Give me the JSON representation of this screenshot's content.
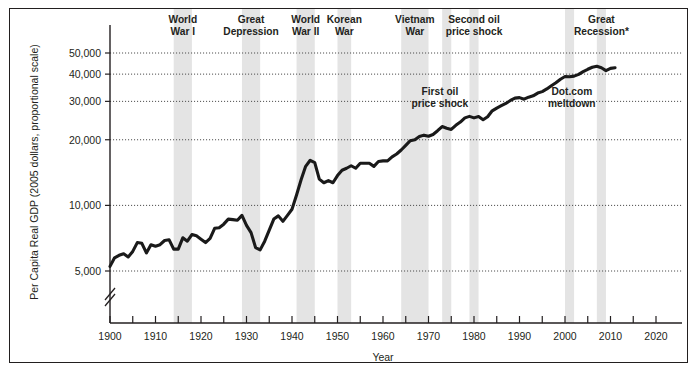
{
  "figure": {
    "background_color": "#ffffff",
    "border_color": "#221f1f",
    "line_color": "#1a1a1a",
    "band_color": "#e4e4e4",
    "grid_color": "#4d4d4d"
  },
  "chart_data": {
    "type": "line",
    "title": "",
    "xlabel": "Year",
    "ylabel": "Per Capita Real GDP (2005 dollars, proportional scale)",
    "yscale": "log",
    "ylim": [
      4300,
      57000
    ],
    "xlim": [
      1900,
      2020
    ],
    "grid": true,
    "legend": "none",
    "axis_break": true,
    "ytick_labels": [
      "5,000",
      "10,000",
      "20,000",
      "30,000",
      "40,000",
      "50,000"
    ],
    "ytick_values": [
      5000,
      10000,
      20000,
      30000,
      40000,
      50000
    ],
    "xtick_labels": [
      "1900",
      "1910",
      "1920",
      "1930",
      "1940",
      "1950",
      "1960",
      "1970",
      "1980",
      "1990",
      "2000",
      "2010",
      "2020"
    ],
    "xtick_values": [
      1900,
      1910,
      1920,
      1930,
      1940,
      1950,
      1960,
      1970,
      1980,
      1990,
      2000,
      2010,
      2020
    ],
    "xminor_values": [
      1905,
      1915,
      1925,
      1935,
      1945,
      1955,
      1965,
      1975,
      1985,
      1995,
      2005,
      2015
    ],
    "series_name": "Per Capita Real GDP",
    "x": [
      1900,
      1901,
      1902,
      1903,
      1904,
      1905,
      1906,
      1907,
      1908,
      1909,
      1910,
      1911,
      1912,
      1913,
      1914,
      1915,
      1916,
      1917,
      1918,
      1919,
      1920,
      1921,
      1922,
      1923,
      1924,
      1925,
      1926,
      1927,
      1928,
      1929,
      1930,
      1931,
      1932,
      1933,
      1934,
      1935,
      1936,
      1937,
      1938,
      1939,
      1940,
      1941,
      1942,
      1943,
      1944,
      1945,
      1946,
      1947,
      1948,
      1949,
      1950,
      1951,
      1952,
      1953,
      1954,
      1955,
      1956,
      1957,
      1958,
      1959,
      1960,
      1961,
      1962,
      1963,
      1964,
      1965,
      1966,
      1967,
      1968,
      1969,
      1970,
      1971,
      1972,
      1973,
      1974,
      1975,
      1976,
      1977,
      1978,
      1979,
      1980,
      1981,
      1982,
      1983,
      1984,
      1985,
      1986,
      1987,
      1988,
      1989,
      1990,
      1991,
      1992,
      1993,
      1994,
      1995,
      1996,
      1997,
      1998,
      1999,
      2000,
      2001,
      2002,
      2003,
      2004,
      2005,
      2006,
      2007,
      2008,
      2009,
      2010,
      2011
    ],
    "values": [
      5250,
      5750,
      5900,
      6000,
      5800,
      6150,
      6750,
      6700,
      6050,
      6600,
      6500,
      6600,
      6900,
      6950,
      6300,
      6300,
      7100,
      6850,
      7350,
      7250,
      7000,
      6750,
      7050,
      7850,
      7900,
      8200,
      8650,
      8600,
      8550,
      9000,
      8100,
      7500,
      6400,
      6250,
      6850,
      7700,
      8650,
      8950,
      8450,
      9000,
      9600,
      11150,
      13100,
      15100,
      16100,
      15700,
      13200,
      12700,
      13000,
      12700,
      13700,
      14500,
      14800,
      15200,
      14800,
      15600,
      15600,
      15600,
      15100,
      15900,
      16000,
      16000,
      16700,
      17200,
      17950,
      18850,
      19800,
      20000,
      20700,
      21000,
      20750,
      21150,
      22000,
      23000,
      22600,
      22300,
      23300,
      24100,
      25200,
      25600,
      25200,
      25550,
      24700,
      25500,
      27150,
      27950,
      28650,
      29350,
      30300,
      31050,
      31200,
      30700,
      31350,
      31800,
      32750,
      33250,
      34200,
      35400,
      36550,
      37900,
      39000,
      38900,
      39150,
      39900,
      41100,
      42100,
      43000,
      43500,
      42800,
      41500,
      42500,
      42800
    ],
    "events": [
      {
        "label_line1": "World",
        "label_line2": "War I",
        "start": 1914,
        "end": 1918,
        "anchor": 1916
      },
      {
        "label_line1": "Great",
        "label_line2": "Depression",
        "start": 1929,
        "end": 1933,
        "anchor": 1931
      },
      {
        "label_line1": "World",
        "label_line2": "War II",
        "start": 1941,
        "end": 1945,
        "anchor": 1943
      },
      {
        "label_line1": "Korean",
        "label_line2": "War",
        "start": 1950,
        "end": 1953,
        "anchor": 1951.5
      },
      {
        "label_line1": "Vietnam",
        "label_line2": "War",
        "start": 1964,
        "end": 1970,
        "anchor": 1967
      },
      {
        "label_line1": "Second oil",
        "label_line2": "price shock",
        "start": 1979,
        "end": 1981,
        "anchor": 1980
      },
      {
        "label_line1": "Great",
        "label_line2": "Recession*",
        "start": 2007,
        "end": 2009,
        "anchor": 2008
      }
    ],
    "extra_bands": [
      {
        "start": 1973,
        "end": 1975
      },
      {
        "start": 2000,
        "end": 2002
      }
    ],
    "inline_annotations": [
      {
        "label_line1": "First oil",
        "label_line2": "price shock",
        "x": 1972.5,
        "y_value": 32000
      },
      {
        "label_line1": "Dot.com",
        "label_line2": "meltdown",
        "x": 2001.5,
        "y_value": 32000
      }
    ]
  }
}
